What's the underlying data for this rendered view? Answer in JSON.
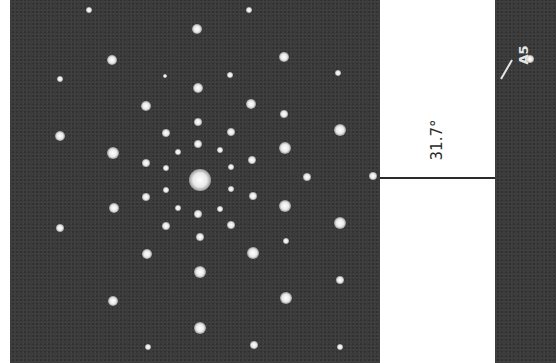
{
  "figure": {
    "left_panel": {
      "description": "electron diffraction pattern",
      "background_color": "#3c3c3c",
      "spot_color": "#f0f0f0",
      "spots": [
        [
          79,
          10,
          3
        ],
        [
          239,
          10,
          3
        ],
        [
          187,
          29,
          5
        ],
        [
          102,
          60,
          5
        ],
        [
          274,
          57,
          5
        ],
        [
          50,
          79,
          3
        ],
        [
          328,
          73,
          3
        ],
        [
          155,
          76,
          2
        ],
        [
          220,
          75,
          3
        ],
        [
          188,
          88,
          5
        ],
        [
          136,
          106,
          5
        ],
        [
          241,
          104,
          5
        ],
        [
          274,
          114,
          4
        ],
        [
          188,
          122,
          4
        ],
        [
          156,
          133,
          4
        ],
        [
          221,
          132,
          4
        ],
        [
          330,
          130,
          6
        ],
        [
          50,
          136,
          5
        ],
        [
          103,
          153,
          6
        ],
        [
          188,
          144,
          4
        ],
        [
          210,
          150,
          3
        ],
        [
          168,
          152,
          3
        ],
        [
          275,
          148,
          6
        ],
        [
          136,
          163,
          4
        ],
        [
          242,
          160,
          4
        ],
        [
          156,
          168,
          3
        ],
        [
          221,
          167,
          3
        ],
        [
          297,
          177,
          4
        ],
        [
          363,
          176,
          4
        ],
        [
          190,
          180,
          11
        ],
        [
          156,
          190,
          3
        ],
        [
          221,
          189,
          3
        ],
        [
          104,
          208,
          5
        ],
        [
          136,
          197,
          4
        ],
        [
          243,
          196,
          4
        ],
        [
          168,
          208,
          3
        ],
        [
          210,
          209,
          3
        ],
        [
          275,
          206,
          6
        ],
        [
          188,
          214,
          4
        ],
        [
          330,
          223,
          6
        ],
        [
          50,
          228,
          4
        ],
        [
          156,
          226,
          4
        ],
        [
          221,
          225,
          4
        ],
        [
          190,
          237,
          4
        ],
        [
          137,
          254,
          5
        ],
        [
          243,
          253,
          6
        ],
        [
          276,
          241,
          3
        ],
        [
          190,
          272,
          6
        ],
        [
          330,
          280,
          4
        ],
        [
          103,
          301,
          5
        ],
        [
          276,
          298,
          6
        ],
        [
          190,
          328,
          6
        ],
        [
          138,
          347,
          3
        ],
        [
          244,
          345,
          4
        ],
        [
          330,
          347,
          3
        ]
      ]
    },
    "angle_annotation": {
      "label": "31.7°",
      "line_color": "#2a2a2a"
    },
    "right_panel": {
      "label": "A5",
      "spots": [
        [
          35,
          59,
          4
        ]
      ]
    }
  }
}
